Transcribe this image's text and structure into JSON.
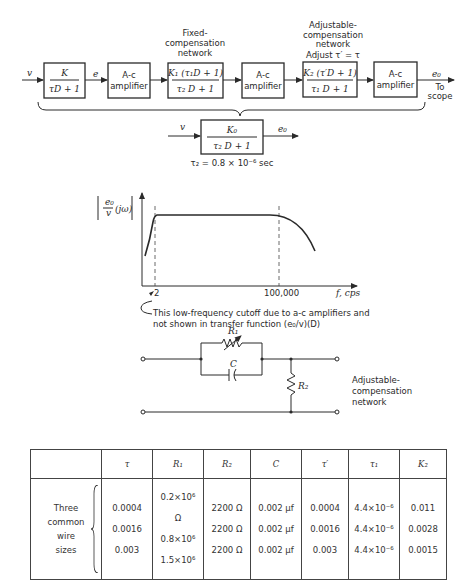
{
  "block_diagram": {
    "input_label": "v",
    "blocks": [
      {
        "id": "plant",
        "numerator": "K",
        "denominator": "τD + 1"
      },
      {
        "id": "amp1",
        "text_line1": "A-c",
        "text_line2": "amplifier"
      },
      {
        "id": "fixed",
        "caption": [
          "Fixed-",
          "compensation",
          "network"
        ],
        "numerator": "K₁ (τ₁D + 1)",
        "denominator": "τ₂ D + 1"
      },
      {
        "id": "amp2",
        "text_line1": "A-c",
        "text_line2": "amplifier"
      },
      {
        "id": "adjustable",
        "caption": [
          "Adjustable-",
          "compensation",
          "network",
          "Adjust τ′ = τ"
        ],
        "numerator": "K₂ (τ′D + 1)",
        "denominator": "τ₁ D + 1"
      },
      {
        "id": "amp3",
        "text_line1": "A-c",
        "text_line2": "amplifier"
      }
    ],
    "signal_e": "e",
    "output_label": "e₀",
    "output_note": [
      "To",
      "scope"
    ]
  },
  "equivalent": {
    "input_label": "v",
    "numerator": "K₀",
    "denominator": "τ₂ D + 1",
    "output_label": "e₀",
    "note": "τ₂ = 0.8 × 10⁻⁶ sec"
  },
  "response_plot": {
    "ylabel_num": "e₀",
    "ylabel_den": "v",
    "ylabel_arg": "(jω)",
    "xlabel": "f, cps",
    "markers": [
      "2",
      "100,000"
    ],
    "annotation": [
      "This low-frequency cutoff due to a-c amplifiers and",
      "not shown in transfer function (e₀/v)(D)"
    ]
  },
  "circuit": {
    "r1_label": "R₁",
    "c_label": "C",
    "r2_label": "R₂",
    "caption": [
      "Adjustable-",
      "compensation",
      "network"
    ]
  },
  "table": {
    "headers": [
      "",
      "τ",
      "R₁",
      "R₂",
      "C",
      "τ′",
      "τ₁",
      "K₂"
    ],
    "row_group_label": [
      "Three",
      "common",
      "wire",
      "sizes"
    ],
    "rows": [
      [
        "0.0004",
        "0.2×10⁶ Ω",
        "2200 Ω",
        "0.002 μf",
        "0.0004",
        "4.4×10⁻⁶",
        "0.011"
      ],
      [
        "0.0016",
        "0.8×10⁶",
        "2200 Ω",
        "0.002 μf",
        "0.0016",
        "4.4×10⁻⁶",
        "0.0028"
      ],
      [
        "0.003",
        "1.5×10⁶",
        "2200 Ω",
        "0.002 μf",
        "0.003",
        "4.4×10⁻⁶",
        "0.0015"
      ]
    ]
  }
}
